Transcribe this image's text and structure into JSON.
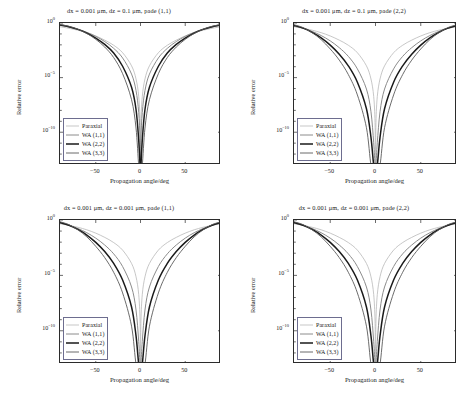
{
  "figure": {
    "axis_labels": {
      "x": "Propagation angle/deg",
      "y": "Relative error"
    },
    "legend_position": "lower-left-inside"
  },
  "series_styles": [
    {
      "name": "Paraxial",
      "color": "#b9b9b9",
      "width": 0.8
    },
    {
      "name": "WA (1,1)",
      "color": "#8c8c8c",
      "width": 1.0
    },
    {
      "name": "WA (2,2)",
      "color": "#1a1a1a",
      "width": 1.5
    },
    {
      "name": "WA (3,3)",
      "color": "#5a5a5a",
      "width": 0.9
    }
  ],
  "panels": [
    {
      "id": "top-left",
      "title": "dx = 0.001 μm, dz = 0.1 μm, pade (1,1)",
      "legend": [
        "Paraxial",
        "WA (1,1)",
        "WA (2,2)",
        "WA (3,3)"
      ],
      "chart_data": {
        "type": "line",
        "title": "dx = 0.001 μm, dz = 0.1 μm, pade (1,1)",
        "xlabel": "Propagation angle/deg",
        "ylabel": "Relative error",
        "xlim": [
          -90,
          90
        ],
        "ylim": [
          1e-13,
          1
        ],
        "yscale": "log",
        "xticks": [
          -50,
          0,
          50
        ],
        "yticks": [
          1,
          1e-05,
          1e-10
        ],
        "ytick_labels": [
          "10^0",
          "10^-5",
          "10^-10"
        ],
        "grid": false,
        "x": [
          -90,
          -80,
          -70,
          -60,
          -50,
          -40,
          -30,
          -20,
          -10,
          -5,
          -2,
          -0.5,
          0,
          0.5,
          2,
          5,
          10,
          20,
          30,
          40,
          50,
          60,
          70,
          80,
          90
        ],
        "series": [
          {
            "name": "Paraxial",
            "values": [
              0.45,
              0.33,
              0.22,
              0.13,
              0.065,
              0.027,
              0.0092,
              0.0019,
              0.00012,
              7.5e-06,
              1.9e-07,
              7.5e-10,
              1e-13,
              7.5e-10,
              1.9e-07,
              7.5e-06,
              0.00012,
              0.0019,
              0.0092,
              0.027,
              0.065,
              0.13,
              0.22,
              0.33,
              0.45
            ]
          },
          {
            "name": "WA (1,1)",
            "values": [
              0.6,
              0.43,
              0.27,
              0.14,
              0.06,
              0.02,
              0.0048,
              0.00063,
              2.1e-05,
              6.5e-07,
              6.6e-09,
              2.6e-11,
              1e-13,
              2.6e-11,
              6.6e-09,
              6.5e-07,
              2.1e-05,
              0.00063,
              0.0048,
              0.02,
              0.06,
              0.14,
              0.27,
              0.43,
              0.6
            ]
          },
          {
            "name": "WA (2,2)",
            "values": [
              0.66,
              0.46,
              0.26,
              0.12,
              0.042,
              0.011,
              0.0018,
              0.00011,
              1.3e-06,
              1.2e-08,
              1.9e-11,
              1e-13,
              1e-13,
              1e-13,
              1.9e-11,
              1.2e-08,
              1.3e-06,
              0.00011,
              0.0018,
              0.011,
              0.042,
              0.12,
              0.26,
              0.46,
              0.66
            ]
          },
          {
            "name": "WA (3,3)",
            "values": [
              0.72,
              0.5,
              0.27,
              0.11,
              0.032,
              0.0063,
              0.00069,
              2.3e-05,
              9.5e-08,
              2.4e-10,
              1e-13,
              1e-13,
              1e-13,
              1e-13,
              1e-13,
              2.4e-10,
              9.5e-08,
              2.3e-05,
              0.00069,
              0.0063,
              0.032,
              0.11,
              0.27,
              0.5,
              0.72
            ]
          }
        ]
      }
    },
    {
      "id": "top-right",
      "title": "dx = 0.001 μm, dz = 0.1 μm, pade (2,2)",
      "legend": [
        "Paraxial",
        "WA (1,1)",
        "WA (2,2)",
        "WA (3,3)"
      ],
      "chart_data": {
        "type": "line",
        "title": "dx = 0.001 μm, dz = 0.1 μm, pade (2,2)",
        "xlabel": "Propagation angle/deg",
        "ylabel": "Relative error",
        "xlim": [
          -90,
          90
        ],
        "ylim": [
          1e-13,
          1
        ],
        "yscale": "log",
        "xticks": [
          -50,
          0,
          50
        ],
        "yticks": [
          1,
          1e-05,
          1e-10
        ],
        "ytick_labels": [
          "10^0",
          "10^-5",
          "10^-10"
        ],
        "grid": false,
        "x": [
          -90,
          -80,
          -70,
          -60,
          -50,
          -40,
          -30,
          -20,
          -10,
          -5,
          -2,
          -0.5,
          0,
          0.5,
          2,
          5,
          10,
          20,
          30,
          40,
          50,
          60,
          70,
          80,
          90
        ],
        "series": [
          {
            "name": "Paraxial",
            "values": [
              0.45,
              0.33,
              0.22,
              0.13,
              0.065,
              0.027,
              0.0092,
              0.0019,
              0.00012,
              7.5e-06,
              1.9e-07,
              7.5e-10,
              1e-13,
              7.5e-10,
              1.9e-07,
              7.5e-06,
              0.00012,
              0.0019,
              0.0092,
              0.027,
              0.065,
              0.13,
              0.22,
              0.33,
              0.45
            ]
          },
          {
            "name": "WA (1,1)",
            "values": [
              0.52,
              0.33,
              0.17,
              0.071,
              0.023,
              0.0055,
              0.00088,
              6.3e-05,
              9e-07,
              7.5e-09,
              1.1e-11,
              1e-13,
              1e-13,
              1e-13,
              1.1e-11,
              7.5e-09,
              9e-07,
              6.3e-05,
              0.00088,
              0.0055,
              0.023,
              0.071,
              0.17,
              0.33,
              0.52
            ]
          },
          {
            "name": "WA (2,2)",
            "values": [
              0.6,
              0.34,
              0.14,
              0.044,
              0.0095,
              0.0014,
              0.00012,
              3.8e-06,
              1.4e-08,
              3.4e-11,
              1e-13,
              1e-13,
              1e-13,
              1e-13,
              1e-13,
              3.4e-11,
              1.4e-08,
              3.8e-06,
              0.00012,
              0.0014,
              0.0095,
              0.044,
              0.14,
              0.34,
              0.6
            ]
          },
          {
            "name": "WA (3,3)",
            "values": [
              0.7,
              0.38,
              0.13,
              0.03,
              0.0042,
              0.0004,
              1.9e-05,
              2.6e-07,
              2.6e-10,
              1e-13,
              1e-13,
              1e-13,
              1e-13,
              1e-13,
              1e-13,
              1e-13,
              2.6e-10,
              2.6e-07,
              1.9e-05,
              0.0004,
              0.0042,
              0.03,
              0.13,
              0.38,
              0.7
            ]
          }
        ]
      }
    },
    {
      "id": "bottom-left",
      "title": "dx = 0.001 μm, dz = 0.001 μm, pade (1,1)",
      "legend": [
        "Paraxial",
        "WA (1,1)",
        "WA (2,2)",
        "WA (3,3)"
      ],
      "chart_data": {
        "type": "line",
        "title": "dx = 0.001 μm, dz = 0.001 μm, pade (1,1)",
        "xlabel": "Propagation angle/deg",
        "ylabel": "Relative error",
        "xlim": [
          -90,
          90
        ],
        "ylim": [
          1e-13,
          1
        ],
        "yscale": "log",
        "xticks": [
          -50,
          0,
          50
        ],
        "yticks": [
          1,
          1e-05,
          1e-10
        ],
        "ytick_labels": [
          "10^0",
          "10^-5",
          "10^-10"
        ],
        "grid": false,
        "x": [
          -90,
          -80,
          -70,
          -60,
          -50,
          -40,
          -30,
          -20,
          -10,
          -5,
          -2,
          -0.5,
          0,
          0.5,
          2,
          5,
          10,
          20,
          30,
          40,
          50,
          60,
          70,
          80,
          90
        ],
        "series": [
          {
            "name": "Paraxial",
            "values": [
              0.45,
              0.33,
              0.22,
              0.13,
              0.065,
              0.027,
              0.0092,
              0.0019,
              0.00012,
              7.5e-06,
              1.9e-07,
              7.5e-10,
              1e-13,
              7.5e-10,
              1.9e-07,
              7.5e-06,
              0.00012,
              0.0019,
              0.0092,
              0.027,
              0.065,
              0.13,
              0.22,
              0.33,
              0.45
            ]
          },
          {
            "name": "WA (1,1)",
            "values": [
              0.52,
              0.33,
              0.17,
              0.071,
              0.023,
              0.0055,
              0.00088,
              6.3e-05,
              9e-07,
              7.5e-09,
              1.1e-11,
              1e-13,
              1e-13,
              1e-13,
              1.1e-11,
              7.5e-09,
              9e-07,
              6.3e-05,
              0.00088,
              0.0055,
              0.023,
              0.071,
              0.17,
              0.33,
              0.52
            ]
          },
          {
            "name": "WA (2,2)",
            "values": [
              0.6,
              0.34,
              0.14,
              0.044,
              0.0095,
              0.0014,
              0.00012,
              3.8e-06,
              1.4e-08,
              3.4e-11,
              1e-13,
              1e-13,
              1e-13,
              1e-13,
              1e-13,
              3.4e-11,
              1.4e-08,
              3.8e-06,
              0.00012,
              0.0014,
              0.0095,
              0.044,
              0.14,
              0.34,
              0.6
            ]
          },
          {
            "name": "WA (3,3)",
            "values": [
              0.7,
              0.38,
              0.13,
              0.03,
              0.0042,
              0.0004,
              1.9e-05,
              2.6e-07,
              2.6e-10,
              1e-13,
              1e-13,
              1e-13,
              1e-13,
              1e-13,
              1e-13,
              1e-13,
              2.6e-10,
              2.6e-07,
              1.9e-05,
              0.0004,
              0.0042,
              0.03,
              0.13,
              0.38,
              0.7
            ]
          }
        ]
      }
    },
    {
      "id": "bottom-right",
      "title": "dx = 0.001 μm, dz = 0.001 μm, pade (2,2)",
      "legend": [
        "Paraxial",
        "WA (1,1)",
        "WA (2,2)",
        "WA (3,3)"
      ],
      "chart_data": {
        "type": "line",
        "title": "dx = 0.001 μm, dz = 0.001 μm, pade (2,2)",
        "xlabel": "Propagation angle/deg",
        "ylabel": "Relative error",
        "xlim": [
          -90,
          90
        ],
        "ylim": [
          1e-13,
          1
        ],
        "yscale": "log",
        "xticks": [
          -50,
          0,
          50
        ],
        "yticks": [
          1,
          1e-05,
          1e-10
        ],
        "ytick_labels": [
          "10^0",
          "10^-5",
          "10^-10"
        ],
        "grid": false,
        "x": [
          -90,
          -80,
          -70,
          -60,
          -50,
          -40,
          -30,
          -20,
          -10,
          -5,
          -2,
          -0.5,
          0,
          0.5,
          2,
          5,
          10,
          20,
          30,
          40,
          50,
          60,
          70,
          80,
          90
        ],
        "series": [
          {
            "name": "Paraxial",
            "values": [
              0.45,
              0.33,
              0.22,
              0.13,
              0.065,
              0.027,
              0.0092,
              0.0019,
              0.00012,
              7.5e-06,
              1.9e-07,
              7.5e-10,
              1e-13,
              7.5e-10,
              1.9e-07,
              7.5e-06,
              0.00012,
              0.0019,
              0.0092,
              0.027,
              0.065,
              0.13,
              0.22,
              0.33,
              0.45
            ]
          },
          {
            "name": "WA (1,1)",
            "values": [
              0.52,
              0.33,
              0.17,
              0.071,
              0.023,
              0.0055,
              0.00088,
              6.3e-05,
              9e-07,
              7.5e-09,
              1.1e-11,
              1e-13,
              1e-13,
              1e-13,
              1.1e-11,
              7.5e-09,
              9e-07,
              6.3e-05,
              0.00088,
              0.0055,
              0.023,
              0.071,
              0.17,
              0.33,
              0.52
            ]
          },
          {
            "name": "WA (2,2)",
            "values": [
              0.6,
              0.34,
              0.14,
              0.044,
              0.0095,
              0.0014,
              0.00012,
              3.8e-06,
              1.4e-08,
              3.4e-11,
              1e-13,
              1e-13,
              1e-13,
              1e-13,
              1e-13,
              3.4e-11,
              1.4e-08,
              3.8e-06,
              0.00012,
              0.0014,
              0.0095,
              0.044,
              0.14,
              0.34,
              0.6
            ]
          },
          {
            "name": "WA (3,3)",
            "values": [
              0.7,
              0.38,
              0.13,
              0.03,
              0.0042,
              0.0004,
              1.9e-05,
              2.6e-07,
              2.6e-10,
              1e-13,
              1e-13,
              1e-13,
              1e-13,
              1e-13,
              1e-13,
              1e-13,
              2.6e-10,
              2.6e-07,
              1.9e-05,
              0.0004,
              0.0042,
              0.03,
              0.13,
              0.38,
              0.7
            ]
          }
        ]
      }
    }
  ]
}
